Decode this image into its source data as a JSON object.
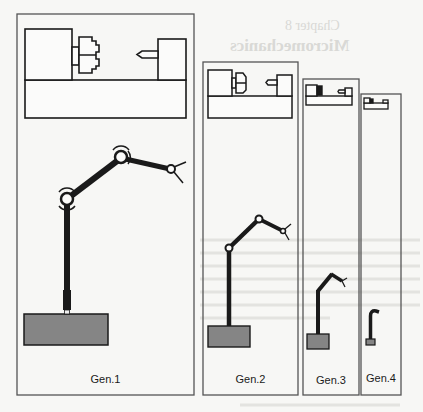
{
  "figure": {
    "background_showthrough": {
      "heading_1": "Chapter 8",
      "heading_2": "Micromechanics"
    },
    "panels": [
      {
        "label": "Gen.1",
        "box": [
          17,
          14,
          194,
          395
        ],
        "lathe": [
          25,
          29,
          186,
          118
        ],
        "base": [
          24,
          314,
          108,
          345
        ]
      },
      {
        "label": "Gen.2",
        "box": [
          203,
          62,
          298,
          395
        ],
        "lathe": [
          208,
          70,
          292,
          118
        ],
        "base": [
          208,
          326,
          250,
          347
        ]
      },
      {
        "label": "Gen.3",
        "box": [
          303,
          79,
          359,
          395
        ],
        "lathe": [
          306,
          84,
          352,
          105
        ],
        "base": [
          307,
          334,
          329,
          349
        ]
      },
      {
        "label": "Gen.4",
        "box": [
          361,
          94,
          401,
          395
        ],
        "lathe": [
          364,
          98,
          388,
          108
        ],
        "base": [
          366,
          339,
          375,
          345
        ]
      }
    ],
    "colors": {
      "stroke": "#1a1a1a",
      "base_fill": "#858585",
      "box_stroke": "#555555",
      "paper": "#f7f7f5"
    }
  }
}
